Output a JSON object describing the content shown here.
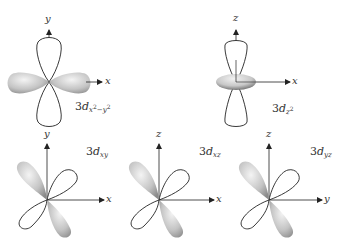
{
  "figure": {
    "orbitals": [
      {
        "id": "dx2y2",
        "prefix": "3",
        "d": "d",
        "sub": "x",
        "sup1": "2",
        "sub_mid": "−y",
        "sup2": "2",
        "axes": {
          "vertical": "y",
          "horizontal": "x"
        }
      },
      {
        "id": "dz2",
        "prefix": "3",
        "d": "d",
        "sub": "z",
        "sup1": "2",
        "axes": {
          "vertical": "z",
          "horizontal": "x"
        }
      },
      {
        "id": "dxy",
        "prefix": "3",
        "d": "d",
        "sub": "xy",
        "axes": {
          "vertical": "y",
          "horizontal": "x"
        }
      },
      {
        "id": "dxz",
        "prefix": "3",
        "d": "d",
        "sub": "xz",
        "axes": {
          "vertical": "z",
          "horizontal": "x"
        }
      },
      {
        "id": "dyz",
        "prefix": "3",
        "d": "d",
        "sub": "yz",
        "axes": {
          "vertical": "z",
          "horizontal": "y"
        }
      }
    ],
    "colors": {
      "lobe_fill_light": "#ececec",
      "lobe_fill_dark": "#8a8a8a",
      "outline": "#222222",
      "axis": "#222222"
    }
  }
}
